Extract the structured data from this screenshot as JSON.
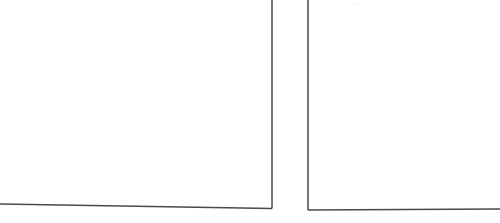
{
  "document": {
    "kind": "scanned-page-fragment",
    "description": "Scanned paper showing two ruled frame corners separated by a gutter",
    "width": 500,
    "height": 223,
    "background_color": "#ffffff",
    "ink_color": "#4a4a4a",
    "ink_color_soft": "#6e6e6e",
    "stroke_width": 1.5,
    "text_content": ""
  },
  "left_frame": {
    "name": "left-frame",
    "label": "",
    "vertical_rule": {
      "x": 272.0,
      "y_top": 0,
      "y_bottom": 208.5,
      "clipped_at_top": true
    },
    "horizontal_rule": {
      "x_left": 0,
      "y_left": 204.0,
      "x_right": 272.0,
      "y_right": 208.5,
      "clipped_at_left": true
    },
    "corner": {
      "x": 272.0,
      "y": 208.5,
      "type": "bottom-right"
    }
  },
  "right_frame": {
    "name": "right-frame",
    "label": "",
    "vertical_rule": {
      "x": 308.0,
      "y_top": 0,
      "y_bottom": 210.0,
      "clipped_at_top": true
    },
    "horizontal_rule": {
      "x_left": 308.0,
      "y_left": 210.0,
      "x_right": 500,
      "y_right": 209.0,
      "clipped_at_right": true
    },
    "corner": {
      "x": 308.0,
      "y": 210.0,
      "type": "bottom-left"
    }
  },
  "gutter": {
    "name": "gutter",
    "x_start": 272.0,
    "x_end": 308.0,
    "width": 36.0,
    "label": ""
  },
  "artifacts": [
    {
      "name": "paper-blotch",
      "x": 352,
      "y": 1,
      "width": 7,
      "height": 5
    }
  ]
}
